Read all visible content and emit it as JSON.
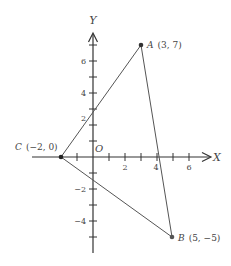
{
  "diagram": {
    "type": "coordinate-plane-triangle",
    "axes": {
      "x_label": "X",
      "y_label": "Y",
      "origin_label": "O",
      "x_tick_labels": [
        "2",
        "4",
        "6"
      ],
      "y_tick_labels": [
        "6",
        "4",
        "2",
        "−2",
        "−4"
      ]
    },
    "points": [
      {
        "name": "A",
        "coords": "(3, 7)",
        "x": 3,
        "y": 7
      },
      {
        "name": "B",
        "coords": "(5, −5)",
        "x": 5,
        "y": -5
      },
      {
        "name": "C",
        "coords": "(−2, 0)",
        "x": -2,
        "y": 0
      }
    ],
    "segments": [
      "AB",
      "BC",
      "CA"
    ],
    "colors": {
      "axis": "#333333",
      "line": "#555555",
      "text": "#444444"
    }
  }
}
